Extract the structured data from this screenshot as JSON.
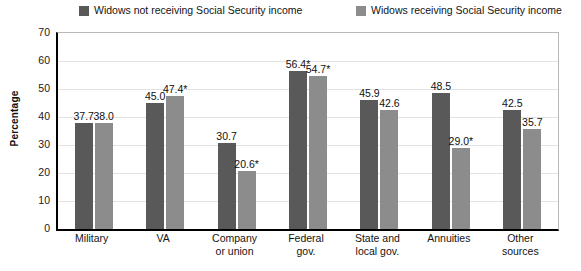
{
  "chart_data": {
    "type": "bar",
    "title": "",
    "subtitle": "",
    "xlabel": "",
    "ylabel": "Percentage",
    "ylim": [
      0,
      70
    ],
    "yticks": [
      "0",
      "10",
      "20",
      "30",
      "40",
      "50",
      "60",
      "70"
    ],
    "ytick_values": [
      0,
      10,
      20,
      30,
      40,
      50,
      60,
      70
    ],
    "grid": true,
    "legend_position": "top",
    "categories": [
      "Military",
      "VA",
      "Company or union",
      "Federal gov.",
      "State and local gov.",
      "Annuities",
      "Other sources"
    ],
    "category_lines": [
      [
        "Military"
      ],
      [
        "VA"
      ],
      [
        "Company",
        "or union"
      ],
      [
        "Federal",
        "gov."
      ],
      [
        "State and",
        "local gov."
      ],
      [
        "Annuities"
      ],
      [
        "Other",
        "sources"
      ]
    ],
    "series": [
      {
        "name": "Widows not receiving Social Security income",
        "color": "#595959",
        "values": [
          37.7,
          45.0,
          30.7,
          56.4,
          45.9,
          48.5,
          42.5
        ],
        "labels": [
          "37.7",
          "45.0",
          "30.7",
          "56.4*",
          "45.9",
          "48.5",
          "42.5"
        ]
      },
      {
        "name": "Widows receiving Social Security income",
        "color": "#8c8c8c",
        "values": [
          38.0,
          47.4,
          20.6,
          54.7,
          42.6,
          29.0,
          35.7
        ],
        "labels": [
          "38.0",
          "47.4*",
          "20.6*",
          "54.7*",
          "42.6",
          "29.0*",
          "35.7"
        ]
      }
    ],
    "footnote_marker": "*"
  },
  "legend": {
    "entries": [
      {
        "label": "Widows not receiving Social Security income",
        "color": "#595959"
      },
      {
        "label": "Widows receiving Social Security income",
        "color": "#8c8c8c"
      }
    ]
  },
  "axis": {
    "y_title": "Percentage"
  },
  "colors": {
    "series_0": "#595959",
    "series_1": "#8c8c8c",
    "axis": "#000000",
    "gridline": "#e2e2e2",
    "text": "#131313",
    "background": "#ffffff"
  }
}
